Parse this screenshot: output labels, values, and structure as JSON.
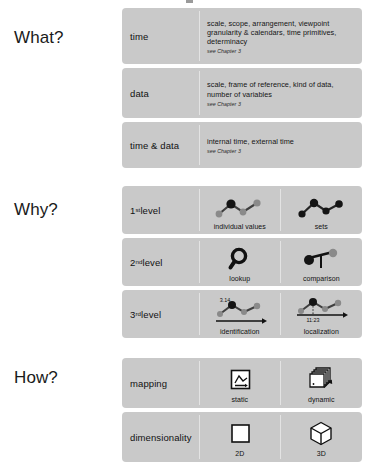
{
  "colors": {
    "panel_background": "#c9c9c9",
    "page_background": "#ffffff",
    "divider": "#e3e3e3",
    "text": "#111111",
    "icon_dark": "#1a1a1a",
    "icon_gray": "#808080"
  },
  "sections": [
    {
      "title": "What?",
      "rows": [
        {
          "label": "time",
          "body": "scale, scope, arrangement, viewpoint granularity & calendars, time primitives, determinacy",
          "chapter": "see Chapter 3"
        },
        {
          "label": "data",
          "body": "scale, frame of reference, kind of data, number of variables",
          "chapter": "see Chapter 3"
        },
        {
          "label": "time & data",
          "body": "internal time, external time",
          "chapter": "see Chapter 3"
        }
      ]
    },
    {
      "title": "Why?",
      "rows": [
        {
          "label": "1st level",
          "label_base": "1",
          "label_sup": "st",
          "label_rest": " level",
          "cells": [
            {
              "icon": "line-chart-one-highlighted-icon",
              "caption": "individual values"
            },
            {
              "icon": "line-chart-all-highlighted-icon",
              "caption": "sets"
            }
          ]
        },
        {
          "label": "2nd level",
          "label_base": "2",
          "label_sup": "nd",
          "label_rest": " level",
          "cells": [
            {
              "icon": "magnifying-glass-icon",
              "caption": "lookup"
            },
            {
              "icon": "balance-scale-icon",
              "caption": "comparison"
            }
          ]
        },
        {
          "label": "3rd level",
          "label_base": "3",
          "label_sup": "rd",
          "label_rest": " level",
          "cells": [
            {
              "icon": "line-chart-value-label-icon",
              "caption": "identification",
              "value_label": "3.14"
            },
            {
              "icon": "line-chart-time-label-icon",
              "caption": "localization",
              "value_label": "11:23"
            }
          ]
        }
      ]
    },
    {
      "title": "How?",
      "rows": [
        {
          "label": "mapping",
          "cells": [
            {
              "icon": "framed-chart-icon",
              "caption": "static"
            },
            {
              "icon": "stacked-cards-arrow-icon",
              "caption": "dynamic"
            }
          ]
        },
        {
          "label": "dimensionality",
          "cells": [
            {
              "icon": "square-2d-icon",
              "caption": "2D"
            },
            {
              "icon": "cube-3d-icon",
              "caption": "3D"
            }
          ]
        }
      ]
    }
  ]
}
